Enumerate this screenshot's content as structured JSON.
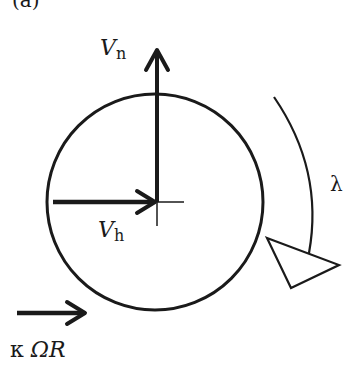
{
  "panel_label": "(a)",
  "labels": {
    "vn_main": "V",
    "vn_sub": "n",
    "vh_main": "V",
    "vh_sub": "h",
    "lambda": "λ",
    "kappa_prefix": "κ ",
    "kappa_omega_r": "ΩR"
  },
  "colors": {
    "stroke": "#1a1a1a",
    "background": "#ffffff"
  }
}
